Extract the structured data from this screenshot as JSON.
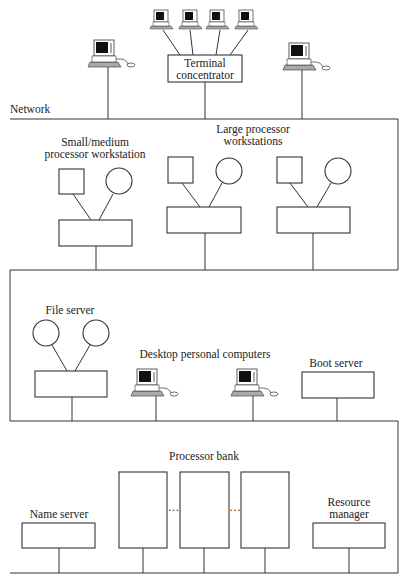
{
  "diagram": {
    "network_label": "Network",
    "terminal_concentrator": [
      "Terminal",
      "concentrator"
    ],
    "small_workstation": [
      "Small/medium",
      "processor workstation"
    ],
    "large_workstations": [
      "Large processor",
      "workstations"
    ],
    "file_server": "File server",
    "desktop_pcs": "Desktop personal computers",
    "boot_server": "Boot server",
    "processor_bank": "Processor bank",
    "name_server": "Name server",
    "resource_manager": [
      "Resource",
      "manager"
    ],
    "ellipsis": "···"
  }
}
